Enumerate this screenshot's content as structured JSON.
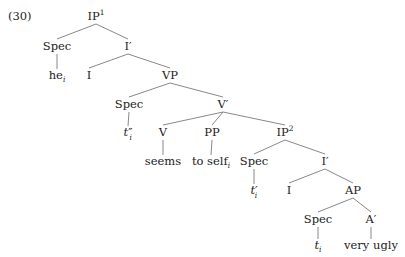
{
  "example_number": "(30)",
  "tree": {
    "nodes": [
      {
        "id": "IP1",
        "label": "IP",
        "sup": "1",
        "x": 96,
        "y": 20
      },
      {
        "id": "Spec1",
        "label": "Spec",
        "x": 57,
        "y": 50
      },
      {
        "id": "he",
        "label": "he",
        "sub": "i",
        "x": 57,
        "y": 79
      },
      {
        "id": "Ibar1",
        "label": "I",
        "prime": "′",
        "x": 128,
        "y": 50
      },
      {
        "id": "I1",
        "label": "I",
        "x": 89,
        "y": 79
      },
      {
        "id": "VP",
        "label": "VP",
        "x": 170,
        "y": 79
      },
      {
        "id": "Spec2",
        "label": "Spec",
        "x": 129,
        "y": 108
      },
      {
        "id": "t2",
        "label": "t",
        "prime": "″",
        "sub": "i",
        "italic": true,
        "x": 128,
        "y": 136
      },
      {
        "id": "Vbar",
        "label": "V",
        "prime": "′",
        "x": 223,
        "y": 108
      },
      {
        "id": "V",
        "label": "V",
        "x": 163,
        "y": 136
      },
      {
        "id": "seems",
        "label": "seems",
        "x": 163,
        "y": 165
      },
      {
        "id": "PP",
        "label": "PP",
        "x": 212,
        "y": 136
      },
      {
        "id": "toself",
        "label": "to self",
        "sub": "i",
        "x": 211,
        "y": 165
      },
      {
        "id": "IP2",
        "label": "IP",
        "sup": "2",
        "x": 285,
        "y": 136
      },
      {
        "id": "Spec3",
        "label": "Spec",
        "x": 254,
        "y": 165
      },
      {
        "id": "t1",
        "label": "t",
        "prime": "′",
        "sub": "i",
        "italic": true,
        "x": 254,
        "y": 194
      },
      {
        "id": "Ibar2",
        "label": "I",
        "prime": "′",
        "x": 325,
        "y": 165
      },
      {
        "id": "I2",
        "label": "I",
        "x": 289,
        "y": 194
      },
      {
        "id": "AP",
        "label": "AP",
        "x": 353,
        "y": 194
      },
      {
        "id": "Spec4",
        "label": "Spec",
        "x": 318,
        "y": 223
      },
      {
        "id": "t0",
        "label": "t",
        "sub": "i",
        "italic": true,
        "x": 318,
        "y": 249
      },
      {
        "id": "Abar",
        "label": "A",
        "prime": "′",
        "x": 371,
        "y": 223
      },
      {
        "id": "veryugly",
        "label": "very ugly",
        "x": 371,
        "y": 249
      }
    ],
    "edges": [
      [
        "IP1",
        "Spec1"
      ],
      [
        "IP1",
        "Ibar1"
      ],
      [
        "Spec1",
        "he"
      ],
      [
        "Ibar1",
        "I1"
      ],
      [
        "Ibar1",
        "VP"
      ],
      [
        "VP",
        "Spec2"
      ],
      [
        "VP",
        "Vbar"
      ],
      [
        "Spec2",
        "t2"
      ],
      [
        "Vbar",
        "V"
      ],
      [
        "Vbar",
        "PP"
      ],
      [
        "Vbar",
        "IP2"
      ],
      [
        "V",
        "seems"
      ],
      [
        "PP",
        "toself"
      ],
      [
        "IP2",
        "Spec3"
      ],
      [
        "IP2",
        "Ibar2"
      ],
      [
        "Spec3",
        "t1"
      ],
      [
        "Ibar2",
        "I2"
      ],
      [
        "Ibar2",
        "AP"
      ],
      [
        "AP",
        "Spec4"
      ],
      [
        "AP",
        "Abar"
      ],
      [
        "Spec4",
        "t0"
      ],
      [
        "Abar",
        "veryugly"
      ]
    ]
  }
}
